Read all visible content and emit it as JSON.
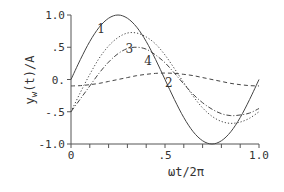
{
  "chart_data": {
    "type": "line",
    "title": "",
    "xlabel": "ωt/2π",
    "ylabel": "y_w(t)/A",
    "ylabel_parts": {
      "main": "y",
      "sub": "w",
      "rest": "(t)/A"
    },
    "xlim": [
      0,
      1.0
    ],
    "ylim": [
      -1.0,
      1.0
    ],
    "grid": false,
    "legend": "inline curve numbers",
    "x_ticks": [
      0,
      0.1,
      0.2,
      0.3,
      0.4,
      0.5,
      0.6,
      0.7,
      0.8,
      0.9,
      1.0
    ],
    "x_tick_labels": [
      {
        "value": 0,
        "label": "0"
      },
      {
        "value": 0.5,
        "label": ".5"
      },
      {
        "value": 1.0,
        "label": "1.0"
      }
    ],
    "y_ticks": [
      -1.0,
      -0.5,
      0,
      0.5,
      1.0
    ],
    "y_tick_labels": [
      {
        "value": 1.0,
        "label": "1.0"
      },
      {
        "value": 0.5,
        "label": ".5"
      },
      {
        "value": 0,
        "label": "0."
      },
      {
        "value": -0.5,
        "label": "-.5"
      },
      {
        "value": -1.0,
        "label": "-1.0"
      }
    ],
    "x": [
      0,
      0.05,
      0.1,
      0.15,
      0.2,
      0.25,
      0.3,
      0.35,
      0.4,
      0.45,
      0.5,
      0.55,
      0.6,
      0.65,
      0.7,
      0.75,
      0.8,
      0.85,
      0.9,
      0.95,
      1.0
    ],
    "series": [
      {
        "name": "1",
        "style": "solid",
        "values": [
          0,
          0.31,
          0.59,
          0.81,
          0.95,
          1.0,
          0.95,
          0.81,
          0.59,
          0.31,
          0,
          -0.31,
          -0.59,
          -0.81,
          -0.95,
          -1.0,
          -0.95,
          -0.81,
          -0.59,
          -0.31,
          0
        ]
      },
      {
        "name": "2",
        "style": "dashed",
        "values": [
          -0.1,
          -0.095,
          -0.08,
          -0.06,
          -0.03,
          0,
          0.03,
          0.06,
          0.08,
          0.095,
          0.1,
          0.095,
          0.08,
          0.06,
          0.03,
          0,
          -0.03,
          -0.06,
          -0.08,
          -0.095,
          -0.1
        ]
      },
      {
        "name": "3",
        "style": "dotted",
        "values": [
          -0.5,
          -0.2,
          0.08,
          0.33,
          0.52,
          0.65,
          0.72,
          0.72,
          0.66,
          0.55,
          0.38,
          0.17,
          -0.05,
          -0.26,
          -0.44,
          -0.57,
          -0.65,
          -0.68,
          -0.66,
          -0.6,
          -0.5
        ]
      },
      {
        "name": "4",
        "style": "dashdot",
        "values": [
          -0.5,
          -0.3,
          -0.1,
          0.1,
          0.27,
          0.4,
          0.48,
          0.5,
          0.47,
          0.38,
          0.26,
          0.1,
          -0.07,
          -0.23,
          -0.36,
          -0.46,
          -0.53,
          -0.56,
          -0.55,
          -0.52,
          -0.45
        ]
      }
    ],
    "annotations": [
      {
        "text": "1",
        "x": 0.16,
        "y": 0.78
      },
      {
        "text": "2",
        "x": 0.52,
        "y": -0.05
      },
      {
        "text": "3",
        "x": 0.31,
        "y": 0.47
      },
      {
        "text": "4",
        "x": 0.41,
        "y": 0.28
      }
    ]
  }
}
